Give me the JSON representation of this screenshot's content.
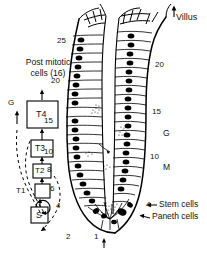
{
  "figure": {
    "type": "diagram",
    "background_color": "#ffffff",
    "line_color": "#000000",
    "nucleus_color": "#000000"
  },
  "lineage_panel": {
    "title_line1": "Post mitotic",
    "title_line2": "cells (16)",
    "compartment_label": "G",
    "boxes": [
      {
        "label": "T4",
        "name": "transit-box-t4"
      },
      {
        "label": "T3",
        "name": "transit-box-t3"
      },
      {
        "label": "T2",
        "name": "transit-box-t2"
      },
      {
        "label": "",
        "name": "transit-box-t1"
      },
      {
        "label": "S",
        "name": "stem-box-s"
      }
    ],
    "t1_label": "T1"
  },
  "crypt": {
    "villus_label": "Villus",
    "left_positions": [
      "25",
      "20",
      "15",
      "10",
      "8",
      "6",
      "4",
      "2"
    ],
    "right_positions": [
      "20",
      "15",
      "10",
      "4"
    ],
    "bottom_position": "1",
    "zone_labels": [
      {
        "text": "G",
        "name": "zone-label-g"
      },
      {
        "text": "M",
        "name": "zone-label-m"
      }
    ],
    "annotations": [
      {
        "text": "Stem cells",
        "name": "annotation-stem-cells"
      },
      {
        "text": "Paneth cells",
        "name": "annotation-paneth-cells"
      }
    ]
  }
}
